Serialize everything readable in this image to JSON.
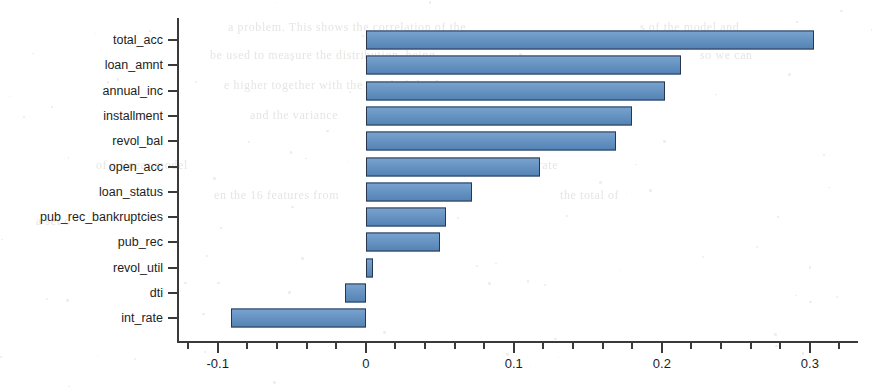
{
  "chart_data": {
    "type": "bar",
    "orientation": "horizontal",
    "title": "",
    "xlabel": "",
    "ylabel": "",
    "categories": [
      "total_acc",
      "loan_amnt",
      "annual_inc",
      "installment",
      "revol_bal",
      "open_acc",
      "loan_status",
      "pub_rec_bankruptcies",
      "pub_rec",
      "revol_util",
      "dti",
      "int_rate"
    ],
    "values": [
      0.303,
      0.213,
      0.202,
      0.18,
      0.169,
      0.118,
      0.072,
      0.054,
      0.05,
      0.005,
      -0.014,
      -0.091
    ],
    "xlim": [
      -0.1275,
      0.3325
    ],
    "xticks": [
      -0.1,
      0,
      0.1,
      0.2,
      0.3
    ],
    "xtick_labels": [
      "-0.1",
      "0",
      "0.1",
      "0.2",
      "0.3"
    ],
    "minor_tick_step": 0.02,
    "grid": false,
    "legend": null,
    "bar_fill_color": "#5b8ec4",
    "bar_edge_color": "#28364f",
    "axis_color": "#3a3a3a",
    "background_color": "#ffffff"
  },
  "ghost_text": [
    {
      "text": "a problem. This shows the correlation of the",
      "x": 228,
      "y": 20,
      "size": 12
    },
    {
      "text": "s of the model and",
      "x": 640,
      "y": 20,
      "size": 12
    },
    {
      "text": "be used to measure the distribution, being",
      "x": 210,
      "y": 48,
      "size": 12
    },
    {
      "text": "so we can",
      "x": 700,
      "y": 48,
      "size": 12
    },
    {
      "text": "e higher together with the trend of the data",
      "x": 224,
      "y": 78,
      "size": 12
    },
    {
      "text": "and the variance",
      "x": 250,
      "y": 108,
      "size": 12
    },
    {
      "text": "of the features",
      "x": 520,
      "y": 108,
      "size": 12
    },
    {
      "text": "of a linear model",
      "x": 96,
      "y": 158,
      "size": 12
    },
    {
      "text": "the learning rate",
      "x": 470,
      "y": 158,
      "size": 12
    },
    {
      "text": "en the 16 features from",
      "x": 214,
      "y": 188,
      "size": 12
    },
    {
      "text": "the total of",
      "x": 560,
      "y": 188,
      "size": 12
    },
    {
      "text": "a set o",
      "x": 36,
      "y": 214,
      "size": 12
    }
  ]
}
